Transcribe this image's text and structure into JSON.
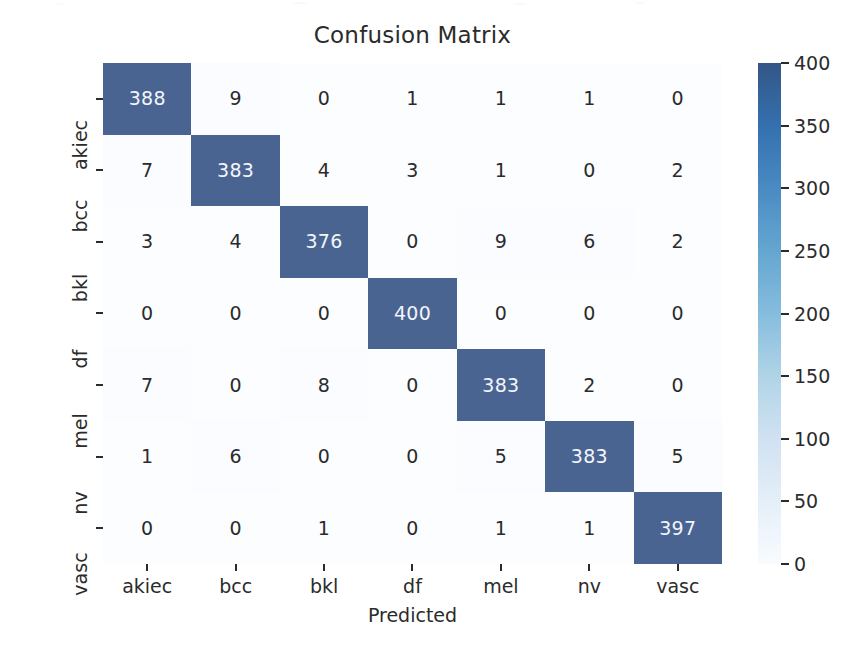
{
  "figure": {
    "background_color": "#ffffff",
    "title": "Confusion Matrix",
    "tick_color": "#2b2b2b"
  },
  "axes": {
    "x_label": "Predicted",
    "y_label": "True"
  },
  "colorbar": {
    "min_color": "#f7fbff",
    "max_color": "#3e5480",
    "ticks": [
      "0",
      "50",
      "100",
      "150",
      "200",
      "250",
      "300",
      "350",
      "400"
    ],
    "tick_values": [
      0,
      50,
      100,
      150,
      200,
      250,
      300,
      350,
      400
    ],
    "vmin": 0,
    "vmax": 400
  },
  "chart_data": {
    "type": "heatmap",
    "title": "Confusion Matrix",
    "xlabel": "Predicted",
    "ylabel": "True",
    "colormap": "Blues",
    "grid": false,
    "legend": "colorbar-right",
    "zlim": [
      0,
      400
    ],
    "categories": [
      "akiec",
      "bcc",
      "bkl",
      "df",
      "mel",
      "nv",
      "vasc"
    ],
    "x_tick_labels": [
      "akiec",
      "bcc",
      "bkl",
      "df",
      "mel",
      "nv",
      "vasc"
    ],
    "y_tick_labels": [
      "akiec",
      "bcc",
      "bkl",
      "df",
      "mel",
      "nv",
      "vasc"
    ],
    "rows": [
      {
        "label": "akiec",
        "values": [
          388,
          9,
          0,
          1,
          1,
          1,
          0
        ]
      },
      {
        "label": "bcc",
        "values": [
          7,
          383,
          4,
          3,
          1,
          0,
          2
        ]
      },
      {
        "label": "bkl",
        "values": [
          3,
          4,
          376,
          0,
          9,
          6,
          2
        ]
      },
      {
        "label": "df",
        "values": [
          0,
          0,
          0,
          400,
          0,
          0,
          0
        ]
      },
      {
        "label": "mel",
        "values": [
          7,
          0,
          8,
          0,
          383,
          2,
          0
        ]
      },
      {
        "label": "nv",
        "values": [
          1,
          6,
          0,
          0,
          5,
          383,
          5
        ]
      },
      {
        "label": "vasc",
        "values": [
          0,
          0,
          1,
          0,
          1,
          1,
          397
        ]
      }
    ]
  }
}
